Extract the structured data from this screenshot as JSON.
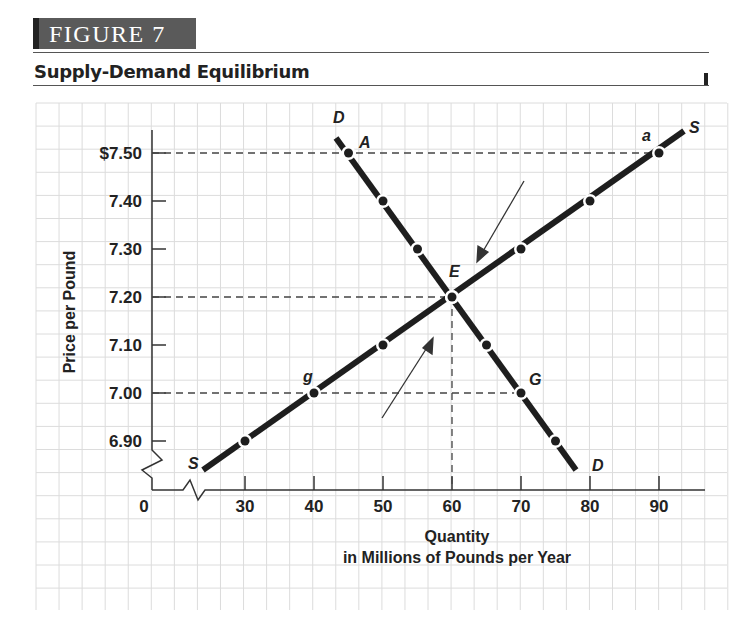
{
  "figure": {
    "label": "FIGURE 7",
    "title": "Supply-Demand Equilibrium"
  },
  "chart_data": {
    "type": "line",
    "title": "Supply-Demand Equilibrium",
    "xlabel": "Quantity in Millions of Pounds per Year",
    "xlabel_lines": [
      "Quantity",
      "in Millions of Pounds per Year"
    ],
    "ylabel": "Price per Pound",
    "x_ticks": [
      "0",
      "30",
      "40",
      "50",
      "60",
      "70",
      "80",
      "90"
    ],
    "y_ticks": [
      "$7.50",
      "7.40",
      "7.30",
      "7.20",
      "7.10",
      "7.00",
      "6.90"
    ],
    "xlim": [
      25,
      95
    ],
    "ylim": [
      6.85,
      7.55
    ],
    "axis_breaks": [
      "x",
      "y"
    ],
    "grid": true,
    "series": [
      {
        "name": "Supply",
        "label_start": "S",
        "label_end": "S",
        "points": [
          {
            "x": 30,
            "y": 6.9
          },
          {
            "x": 40,
            "y": 7.0,
            "label": "g"
          },
          {
            "x": 50,
            "y": 7.1
          },
          {
            "x": 60,
            "y": 7.2,
            "label": "E"
          },
          {
            "x": 70,
            "y": 7.3
          },
          {
            "x": 80,
            "y": 7.4
          },
          {
            "x": 90,
            "y": 7.5,
            "label": "a"
          }
        ]
      },
      {
        "name": "Demand",
        "label_start": "D",
        "label_end": "D",
        "points": [
          {
            "x": 45,
            "y": 7.5,
            "label": "A"
          },
          {
            "x": 50,
            "y": 7.4
          },
          {
            "x": 55,
            "y": 7.3
          },
          {
            "x": 60,
            "y": 7.2,
            "label": "E"
          },
          {
            "x": 65,
            "y": 7.1
          },
          {
            "x": 70,
            "y": 7.0,
            "label": "G"
          },
          {
            "x": 75,
            "y": 6.9
          }
        ]
      }
    ],
    "reference_lines": [
      {
        "type": "horizontal",
        "y": 7.5,
        "from_x": 0,
        "to_x": 90
      },
      {
        "type": "horizontal",
        "y": 7.2,
        "from_x": 0,
        "to_x": 60
      },
      {
        "type": "horizontal",
        "y": 7.0,
        "from_x": 0,
        "to_x": 70
      },
      {
        "type": "vertical",
        "x": 60,
        "from_y": 6.85,
        "to_y": 7.2
      }
    ],
    "annotations": [
      {
        "type": "arrow",
        "direction": "down-left",
        "toward": "E",
        "from": "above-right"
      },
      {
        "type": "arrow",
        "direction": "up-right",
        "toward": "E",
        "from": "below-left"
      }
    ],
    "equilibrium": {
      "label": "E",
      "quantity": 60,
      "price": 7.2
    }
  },
  "labels": {
    "S_start": "S",
    "S_end": "S",
    "D_start": "D",
    "D_end": "D",
    "A": "A",
    "a": "a",
    "E": "E",
    "g": "g",
    "G": "G"
  }
}
